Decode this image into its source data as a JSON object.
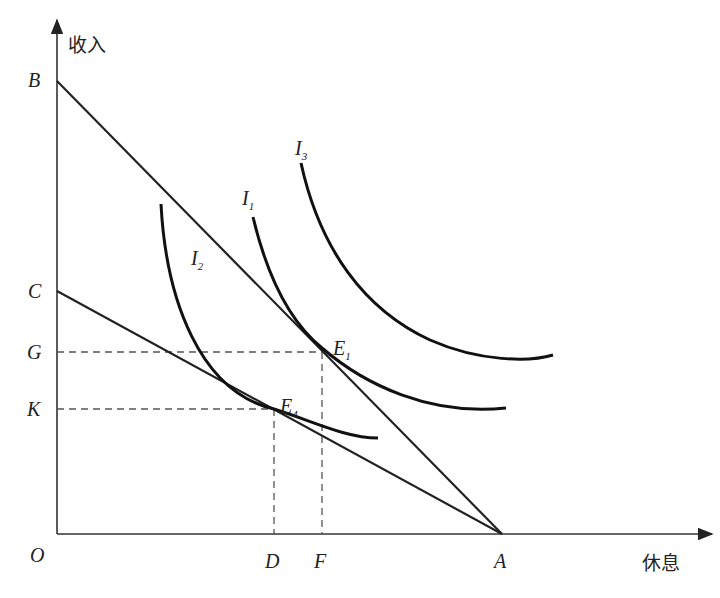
{
  "diagram": {
    "type": "labor-leisure indifference curve diagram",
    "axes": {
      "y_label": "收入",
      "x_label": "休息",
      "origin_label": "O"
    },
    "y_points": [
      "B",
      "C",
      "G",
      "K"
    ],
    "x_points": [
      "D",
      "F",
      "A"
    ],
    "budget_lines": [
      {
        "name": "BA",
        "from": "B",
        "to": "A"
      },
      {
        "name": "CA",
        "from": "C",
        "to": "A"
      }
    ],
    "indifference_curves": [
      {
        "name": "I",
        "sub": "1"
      },
      {
        "name": "I",
        "sub": "2"
      },
      {
        "name": "I",
        "sub": "3"
      }
    ],
    "equilibria": [
      {
        "name": "E",
        "sub": "1",
        "x_ref": "F",
        "y_ref": "G"
      },
      {
        "name": "E",
        "sub": "4",
        "x_ref": "D",
        "y_ref": "K"
      }
    ],
    "colors": {
      "ink": "#222222",
      "dash": "#555555",
      "background": "#ffffff"
    }
  }
}
